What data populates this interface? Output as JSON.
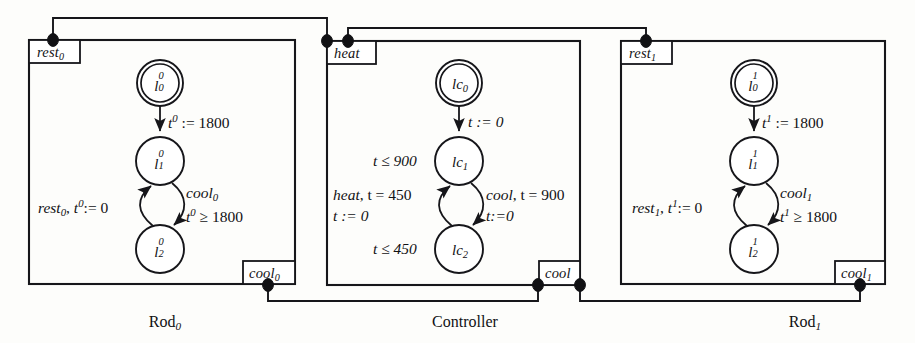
{
  "figure": {
    "background": "#fdfdfb",
    "ink": "#16161a"
  },
  "components": [
    {
      "id": "rod0",
      "caption": "Rod",
      "caption_sub": "0",
      "ports": [
        {
          "name": "rest-port-0",
          "base": "rest",
          "sub": "0",
          "position": "top-left"
        },
        {
          "name": "cool-port-0",
          "base": "cool",
          "sub": "0",
          "position": "bottom-right"
        }
      ],
      "states": [
        {
          "name": "state-l0-rod0",
          "base": "l",
          "sup": "0",
          "sub": "0",
          "initial": true
        },
        {
          "name": "state-l1-rod0",
          "base": "l",
          "sup": "0",
          "sub": "1",
          "initial": false
        },
        {
          "name": "state-l2-rod0",
          "base": "l",
          "sup": "0",
          "sub": "2",
          "initial": false
        }
      ],
      "edge_labels": [
        {
          "name": "init-assign-rod0",
          "text": "t0 := 1800",
          "parts": [
            "t",
            "0",
            " := 1800"
          ]
        },
        {
          "name": "guard-cool-rod0-line1",
          "text": "cool0"
        },
        {
          "name": "guard-cool-rod0-line2",
          "text": "t0 >= 1800"
        },
        {
          "name": "guard-rest-rod0",
          "text": "rest0, t0 := 0"
        }
      ]
    },
    {
      "id": "controller",
      "caption": "Controller",
      "caption_sub": "",
      "ports": [
        {
          "name": "heat-port",
          "base": "heat",
          "sub": "",
          "position": "top-left"
        },
        {
          "name": "cool-port",
          "base": "cool",
          "sub": "",
          "position": "bottom-right"
        }
      ],
      "states": [
        {
          "name": "state-lc0",
          "base": "lc",
          "sup": "",
          "sub": "0",
          "initial": true
        },
        {
          "name": "state-lc1",
          "base": "lc",
          "sup": "",
          "sub": "1",
          "initial": false
        },
        {
          "name": "state-lc2",
          "base": "lc",
          "sup": "",
          "sub": "2",
          "initial": false
        }
      ],
      "edge_labels": [
        {
          "name": "init-assign-controller",
          "text": "t := 0"
        },
        {
          "name": "invariant-lc1",
          "text": "t <= 900"
        },
        {
          "name": "invariant-lc2",
          "text": "t <= 450"
        },
        {
          "name": "guard-heat-line1",
          "text": "heat, t = 450"
        },
        {
          "name": "guard-heat-line2",
          "text": "t := 0"
        },
        {
          "name": "guard-cool-line1",
          "text": "cool, t = 900"
        },
        {
          "name": "guard-cool-line2",
          "text": "t:=0"
        }
      ]
    },
    {
      "id": "rod1",
      "caption": "Rod",
      "caption_sub": "1",
      "ports": [
        {
          "name": "rest-port-1",
          "base": "rest",
          "sub": "1",
          "position": "top-left"
        },
        {
          "name": "cool-port-1",
          "base": "cool",
          "sub": "1",
          "position": "bottom-right"
        }
      ],
      "states": [
        {
          "name": "state-l0-rod1",
          "base": "l",
          "sup": "1",
          "sub": "0",
          "initial": true
        },
        {
          "name": "state-l1-rod1",
          "base": "l",
          "sup": "1",
          "sub": "1",
          "initial": false
        },
        {
          "name": "state-l2-rod1",
          "base": "l",
          "sup": "1",
          "sub": "2",
          "initial": false
        }
      ],
      "edge_labels": [
        {
          "name": "init-assign-rod1",
          "text": "t1 := 1800"
        },
        {
          "name": "guard-cool-rod1-line1",
          "text": "cool1"
        },
        {
          "name": "guard-cool-rod1-line2",
          "text": "t1 >= 1800"
        },
        {
          "name": "guard-rest-rod1",
          "text": "rest1, t1 := 0"
        }
      ]
    }
  ],
  "wires": [
    {
      "name": "wire-rest0-heat",
      "from": "rest-port-0",
      "to": "heat-port"
    },
    {
      "name": "wire-heat-rest1",
      "from": "heat-port",
      "to": "rest-port-1"
    },
    {
      "name": "wire-cool0-cool",
      "from": "cool-port-0",
      "to": "cool-port"
    },
    {
      "name": "wire-cool-cool1",
      "from": "cool-port",
      "to": "cool-port-1"
    }
  ],
  "labels": {
    "rod0": {
      "port_rest": "rest",
      "port_rest_sub": "0",
      "port_cool": "cool",
      "port_cool_sub": "0",
      "node0_base": "l",
      "node0_sup": "0",
      "node0_sub": "0",
      "node1_base": "l",
      "node1_sup": "0",
      "node1_sub": "1",
      "node2_base": "l",
      "node2_sup": "0",
      "node2_sub": "2",
      "init_var": "t",
      "init_sup": "0",
      "init_rest": " := 1800",
      "cool_evt": "cool",
      "cool_evt_sub": "0",
      "guard_var": "t",
      "guard_sup": "0",
      "guard_rest": " ≥ 1800",
      "rest_evt": "rest",
      "rest_evt_sub": "0",
      "rest_mid": ", ",
      "rest_var": "t",
      "rest_sup": "0",
      "rest_rest": ":= 0",
      "caption": "Rod",
      "caption_sub": "0"
    },
    "controller": {
      "port_heat": "heat",
      "port_cool": "cool",
      "node0_base": "lc",
      "node0_sub": "0",
      "node1_base": "lc",
      "node1_sub": "1",
      "node2_base": "lc",
      "node2_sub": "2",
      "init_assign": "t := 0",
      "inv1": "t ≤ 900",
      "inv2": "t ≤ 450",
      "heat_guard_1_evt": "heat",
      "heat_guard_1_rest": ", t = 450",
      "heat_guard_2": "t := 0",
      "cool_guard_1_evt": "cool",
      "cool_guard_1_rest": ", t = 900",
      "cool_guard_2": "t:=0",
      "caption": "Controller"
    },
    "rod1": {
      "port_rest": "rest",
      "port_rest_sub": "1",
      "port_cool": "cool",
      "port_cool_sub": "1",
      "node0_base": "l",
      "node0_sup": "1",
      "node0_sub": "0",
      "node1_base": "l",
      "node1_sup": "1",
      "node1_sub": "1",
      "node2_base": "l",
      "node2_sup": "1",
      "node2_sub": "2",
      "init_var": "t",
      "init_sup": "1",
      "init_rest": " := 1800",
      "cool_evt": "cool",
      "cool_evt_sub": "1",
      "guard_var": "t",
      "guard_sup": "1",
      "guard_rest": " ≥ 1800",
      "rest_evt": "rest",
      "rest_evt_sub": "1",
      "rest_mid": ", ",
      "rest_var": "t",
      "rest_sup": "1",
      "rest_rest": ":= 0",
      "caption": "Rod",
      "caption_sub": "1"
    }
  }
}
